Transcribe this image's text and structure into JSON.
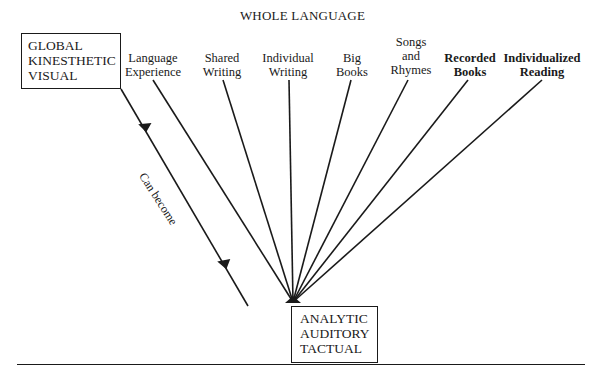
{
  "title": "WHOLE LANGUAGE",
  "start_box": {
    "lines": [
      "GLOBAL",
      "KINESTHETIC",
      "VISUAL"
    ]
  },
  "end_box": {
    "lines": [
      "ANALYTIC",
      "AUDITORY",
      "TACTUAL"
    ]
  },
  "transition_label": "Can become",
  "methods": [
    {
      "id": "language-experience",
      "lines": [
        "Language",
        "Experience"
      ],
      "x": 153,
      "top": 51,
      "bold": false,
      "line_start": [
        153,
        80
      ]
    },
    {
      "id": "shared-writing",
      "lines": [
        "Shared",
        "Writing"
      ],
      "x": 222,
      "top": 51,
      "bold": false,
      "line_start": [
        223,
        80
      ]
    },
    {
      "id": "individual-writing",
      "lines": [
        "Individual",
        "Writing"
      ],
      "x": 288,
      "top": 51,
      "bold": false,
      "line_start": [
        289,
        80
      ]
    },
    {
      "id": "big-books",
      "lines": [
        "Big",
        "Books"
      ],
      "x": 352,
      "top": 51,
      "bold": false,
      "line_start": [
        351,
        80
      ]
    },
    {
      "id": "songs-and-rhymes",
      "lines": [
        "Songs",
        "and",
        "Rhymes"
      ],
      "x": 411,
      "top": 35,
      "bold": false,
      "line_start": [
        408,
        80
      ]
    },
    {
      "id": "recorded-books",
      "lines": [
        "Recorded",
        "Books"
      ],
      "x": 470,
      "top": 51,
      "bold": true,
      "line_start": [
        468,
        80
      ]
    },
    {
      "id": "individualized-reading",
      "lines": [
        "Individualized",
        "Reading"
      ],
      "x": 542,
      "top": 51,
      "bold": true,
      "line_start": [
        542,
        80
      ]
    }
  ],
  "convergence_point": [
    293,
    302
  ],
  "arrow_path": {
    "from": [
      121,
      89
    ],
    "to": [
      297,
      306
    ]
  }
}
